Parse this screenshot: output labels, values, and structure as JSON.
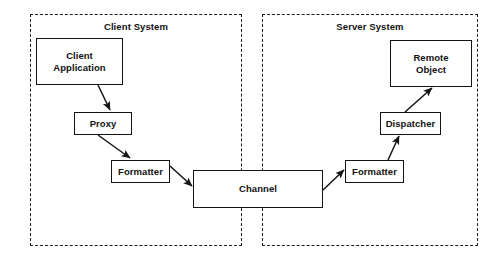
{
  "diagram": {
    "background_color": "#ffffff",
    "stroke_color": "#141414",
    "text_color": "#121212",
    "groups": [
      {
        "id": "client-system",
        "label": "Client System",
        "x": 30,
        "y": 14,
        "width": 212,
        "height": 232,
        "border_style": "dashed"
      },
      {
        "id": "server-system",
        "label": "Server System",
        "x": 262,
        "y": 14,
        "width": 216,
        "height": 232,
        "border_style": "dashed"
      }
    ],
    "nodes": [
      {
        "id": "client-application",
        "label": "Client\nApplication",
        "x": 36,
        "y": 38,
        "width": 87,
        "height": 47
      },
      {
        "id": "proxy",
        "label": "Proxy",
        "x": 74,
        "y": 112,
        "width": 58,
        "height": 23
      },
      {
        "id": "formatter-client",
        "label": "Formatter",
        "x": 111,
        "y": 160,
        "width": 59,
        "height": 23
      },
      {
        "id": "channel",
        "label": "Channel",
        "x": 193,
        "y": 170,
        "width": 130,
        "height": 38
      },
      {
        "id": "formatter-server",
        "label": "Formatter",
        "x": 345,
        "y": 160,
        "width": 59,
        "height": 23
      },
      {
        "id": "dispatcher",
        "label": "Dispatcher",
        "x": 380,
        "y": 112,
        "width": 61,
        "height": 23
      },
      {
        "id": "remote-object",
        "label": "Remote\nObject",
        "x": 390,
        "y": 40,
        "width": 82,
        "height": 47
      }
    ],
    "arrows": [
      {
        "id": "client-application-to-proxy",
        "from": "client-application",
        "to": "proxy",
        "x1": 98,
        "y1": 85,
        "x2": 110,
        "y2": 110
      },
      {
        "id": "proxy-to-formatter-client",
        "from": "proxy",
        "to": "formatter-client",
        "x1": 98,
        "y1": 135,
        "x2": 130,
        "y2": 158
      },
      {
        "id": "formatter-client-to-channel",
        "from": "formatter-client",
        "to": "channel",
        "x1": 170,
        "y1": 166,
        "x2": 192,
        "y2": 186
      },
      {
        "id": "channel-to-formatter-server",
        "from": "channel",
        "to": "formatter-server",
        "x1": 323,
        "y1": 190,
        "x2": 344,
        "y2": 170
      },
      {
        "id": "formatter-server-to-dispatcher",
        "from": "formatter-server",
        "to": "dispatcher",
        "x1": 388,
        "y1": 160,
        "x2": 399,
        "y2": 136
      },
      {
        "id": "dispatcher-to-remote-object",
        "from": "dispatcher",
        "to": "remote-object",
        "x1": 405,
        "y1": 112,
        "x2": 432,
        "y2": 88
      }
    ]
  }
}
